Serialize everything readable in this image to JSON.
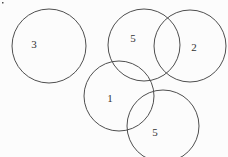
{
  "diagram": {
    "background": "#fcfcfc",
    "stroke_color": "#4f4f4f",
    "label_color": "#333333",
    "width": 228,
    "height": 157,
    "circles": [
      {
        "label": "3",
        "cx": 49,
        "cy": 46,
        "r": 37,
        "label_x": 34,
        "label_y": 48
      },
      {
        "label": "5",
        "cx": 144,
        "cy": 45,
        "r": 36,
        "label_x": 133,
        "label_y": 42
      },
      {
        "label": "2",
        "cx": 190,
        "cy": 46,
        "r": 36,
        "label_x": 194,
        "label_y": 51
      },
      {
        "label": "1",
        "cx": 119,
        "cy": 96,
        "r": 35,
        "label_x": 110,
        "label_y": 102
      },
      {
        "label": "5",
        "cx": 163,
        "cy": 126,
        "r": 36,
        "label_x": 155,
        "label_y": 136
      }
    ],
    "speck": {
      "x": 2,
      "y": 2
    }
  }
}
